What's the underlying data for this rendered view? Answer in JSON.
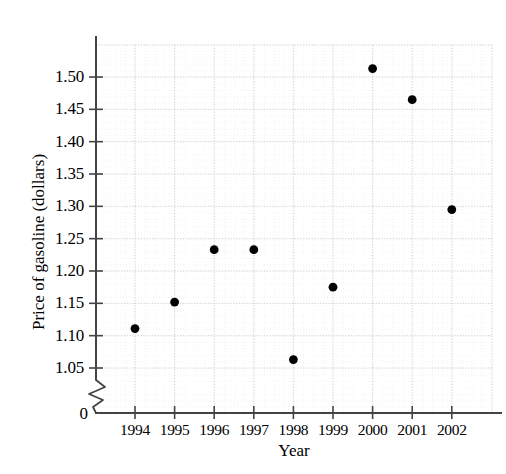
{
  "chart_data": {
    "type": "scatter",
    "title": "",
    "xlabel": "Year",
    "ylabel": "Price of gasoline (dollars)",
    "categories": [
      1994,
      1995,
      1996,
      1997,
      1998,
      1999,
      2000,
      2001,
      2002
    ],
    "x": [
      1994,
      1995,
      1996,
      1997,
      1998,
      1999,
      2000,
      2001,
      2002
    ],
    "values": [
      1.111,
      1.152,
      1.233,
      1.233,
      1.063,
      1.175,
      1.513,
      1.465,
      1.295
    ],
    "series": [
      {
        "name": "Price of gasoline",
        "values": [
          1.111,
          1.152,
          1.233,
          1.233,
          1.063,
          1.175,
          1.513,
          1.465,
          1.295
        ]
      }
    ],
    "xlim": [
      1993.5,
      2002.5
    ],
    "ylim": [
      1.0125,
      1.55
    ],
    "ytick_labels": [
      "1.50",
      "1.45",
      "1.40",
      "1.35",
      "1.30",
      "1.25",
      "1.20",
      "1.15",
      "1.10",
      "1.05"
    ],
    "ytick_values": [
      1.5,
      1.45,
      1.4,
      1.35,
      1.3,
      1.25,
      1.2,
      1.15,
      1.1,
      1.05
    ],
    "xtick_labels": [
      "1994",
      "1995",
      "1996",
      "1997",
      "1998",
      "1999",
      "2000",
      "2001",
      "2002"
    ],
    "origin_label": "0",
    "axis_break": true,
    "grid": true,
    "grid_style": "dotted",
    "legend": "none",
    "marker": "filled-circle",
    "marker_color": "#000000",
    "grid_color": "#cccccc",
    "axis_color": "#444444"
  },
  "axes": {
    "y_title": "Price of gasoline (dollars)",
    "x_title": "Year",
    "origin": "0"
  }
}
